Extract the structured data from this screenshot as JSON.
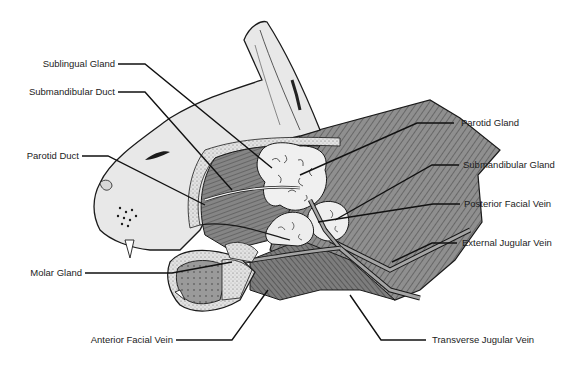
{
  "diagram": {
    "colors": {
      "background": "#ffffff",
      "line": "#1a1a1a",
      "muscle": "#8a8a8a",
      "muscle_dark": "#6e6e6e",
      "skin": "#e6e6e6",
      "gland": "#eeeeee",
      "vein": "#9a9a9a",
      "stipple_band": "#dcdcdc"
    },
    "labels_left": [
      {
        "id": "sublingual-gland",
        "text": "Sublingual Gland"
      },
      {
        "id": "submandibular-duct",
        "text": "Submandibular Duct"
      },
      {
        "id": "parotid-duct",
        "text": "Parotid Duct"
      },
      {
        "id": "molar-gland",
        "text": "Molar Gland"
      },
      {
        "id": "anterior-facial-vein",
        "text": "Anterior Facial Vein"
      }
    ],
    "labels_right": [
      {
        "id": "parotid-gland",
        "text": "Parotid Gland"
      },
      {
        "id": "submandibular-gland",
        "text": "Submandibular Gland"
      },
      {
        "id": "posterior-facial-vein",
        "text": "Posterior Facial Vein"
      },
      {
        "id": "external-jugular-vein",
        "text": "External Jugular Vein"
      },
      {
        "id": "transverse-jugular-vein",
        "text": "Transverse Jugular Vein"
      }
    ]
  }
}
